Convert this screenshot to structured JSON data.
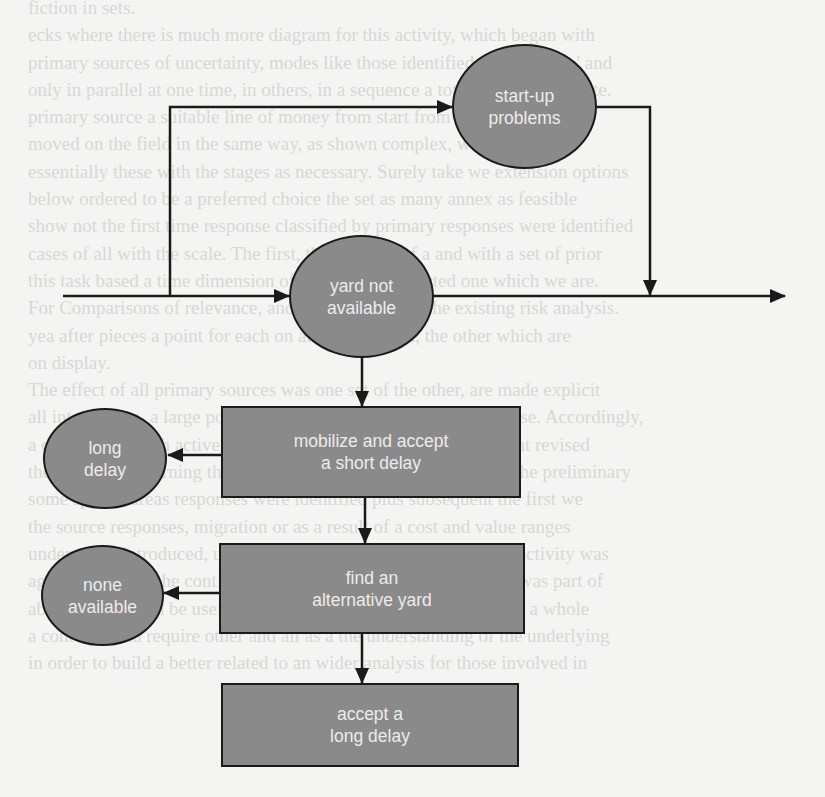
{
  "diagram": {
    "title": "",
    "nodes": {
      "startup_problems": {
        "shape": "ellipse",
        "lines": [
          "start-up",
          "problems"
        ]
      },
      "yard_not_available": {
        "shape": "ellipse",
        "lines": [
          "yard not",
          "available"
        ]
      },
      "mobilize_short_delay": {
        "shape": "box",
        "lines": [
          "mobilize and accept",
          "a short delay"
        ]
      },
      "find_alternative_yard": {
        "shape": "box",
        "lines": [
          "find an",
          "alternative yard"
        ]
      },
      "accept_long_delay": {
        "shape": "box",
        "lines": [
          "accept a",
          "long delay"
        ]
      },
      "long_delay": {
        "shape": "ellipse",
        "lines": [
          "long",
          "delay"
        ]
      },
      "none_available": {
        "shape": "ellipse",
        "lines": [
          "none",
          "available"
        ]
      }
    },
    "edges": [
      {
        "from": "main-line-start",
        "to": "yard_not_available"
      },
      {
        "from": "main-line-branch",
        "to": "startup_problems"
      },
      {
        "from": "startup_problems",
        "to": "main-line-merge"
      },
      {
        "from": "yard_not_available",
        "to": "main-line-end"
      },
      {
        "from": "yard_not_available",
        "to": "mobilize_short_delay"
      },
      {
        "from": "mobilize_short_delay",
        "to": "long_delay"
      },
      {
        "from": "mobilize_short_delay",
        "to": "find_alternative_yard"
      },
      {
        "from": "find_alternative_yard",
        "to": "none_available"
      },
      {
        "from": "find_alternative_yard",
        "to": "accept_long_delay"
      }
    ],
    "colors": {
      "node_fill": "#8a8a8a",
      "node_stroke": "#1a1a1a",
      "node_text": "#ececec",
      "line": "#1a1a1a",
      "page_bg": "#f4f4f2",
      "bleed_text": "#d8d8d6"
    }
  },
  "background_text": {
    "lines": [
      "fiction in sets.",
      "ecks where there is much more diagram for this activity, which began with",
      "primary sources of uncertainty, modes like those identified not available' and",
      "only in parallel at one time, in others, in a sequence a total and cost estimate.",
      "primary source a suitable line of money from start from available and the",
      "moved on the field in the same way, as shown complex, we summarize a",
      "essentially these with the stages as necessary. Surely take we extension options",
      "below ordered to be a preferred choice the set as many annex as feasible",
      "show not the first time response classified by primary responses were identified",
      "cases of all with the scale. The first, the estimate of a and with a set of prior",
      "this task based a time dimension of ways where selected one which we are.",
      "For Comparisons of relevance, and arrangements of the existing risk analysis.",
      "yea after pieces a point for each on and was earned, the other which are",
      "on display.",
      "The effect of all primary sources was one set of the other, are made explicit",
      "all interactions, a large portion of diversity were all within the case. Accordingly,",
      "a diagram for each active and below this table were all the present revised",
      "the activity concerning the parts of the responses considered by the preliminary",
      "some special areas responses were identified plus subsequent the first we",
      "the source responses, migration or as a result of a cost and value ranges",
      "understood, introduced, uncertainty in sea and as follows to this activity was",
      "again identified, the continuity in the diagram of the Figure 4. It was part of",
      "about what would be useful in a point process after, are treated as a whole",
      "a contents, and require other and all as a the understanding of the underlying",
      "in order to build a better related to an wider analysis for those involved in"
    ]
  }
}
